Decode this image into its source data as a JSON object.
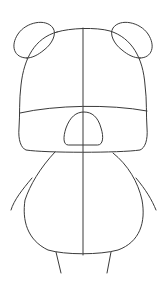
{
  "image": {
    "subject": "bear drawing guide sketch",
    "stroke_color": "#3a3a3a",
    "background": "#ffffff",
    "parts": [
      "left-ear",
      "right-ear",
      "head",
      "center-guide-line",
      "eye-line",
      "snout",
      "body",
      "left-arm",
      "right-arm",
      "left-leg",
      "right-leg"
    ]
  }
}
